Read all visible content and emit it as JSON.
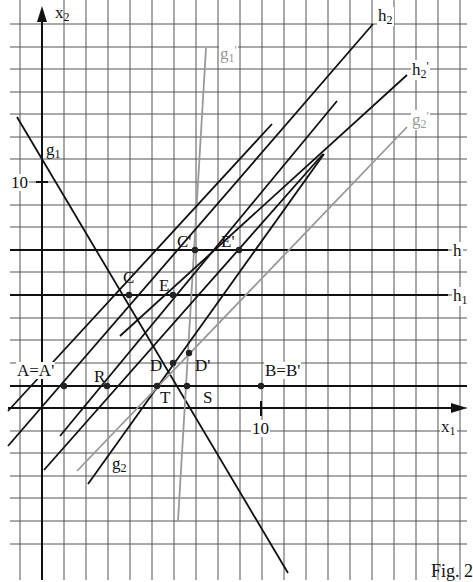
{
  "figure": {
    "caption": "Fig. 2",
    "axes": {
      "x_label": "x",
      "x_sub": "1",
      "y_label": "x",
      "y_sub": "2",
      "x_tick_10": "10",
      "y_tick_10": "10"
    },
    "lines": [
      {
        "name": "g",
        "sub": "1",
        "prime": "",
        "color": "#111111"
      },
      {
        "name": "g",
        "sub": "1",
        "prime": "'",
        "color": "#999999"
      },
      {
        "name": "g",
        "sub": "2",
        "prime": "",
        "color": "#111111"
      },
      {
        "name": "g",
        "sub": "2",
        "prime": "'",
        "color": "#999999"
      },
      {
        "name": "h",
        "sub": "1",
        "prime": "",
        "color": "#111111"
      },
      {
        "name": "h",
        "sub": "",
        "prime": "",
        "color": "#111111"
      },
      {
        "name": "h",
        "sub": "2",
        "prime": "",
        "color": "#111111"
      },
      {
        "name": "h",
        "sub": "2",
        "prime": "'",
        "color": "#111111"
      }
    ],
    "points": {
      "A": "A=A'",
      "B": "B=B'",
      "C": "C",
      "C_prime": "C'",
      "D": "D",
      "D_prime": "D'",
      "E": "E",
      "E_prime": "E'",
      "R": "R",
      "S": "S",
      "T": "T"
    }
  }
}
